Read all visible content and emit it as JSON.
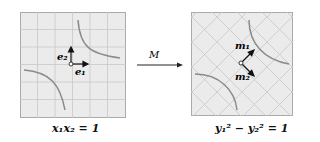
{
  "left_panel": {
    "caption": "x₁x₂ = 1",
    "vector_labels": [
      "e₂",
      "e₁"
    ],
    "background": "#ebebeb",
    "grid_color": "#c8c8c8",
    "curve_color": "#8a8a8a"
  },
  "arrow": {
    "label": "M"
  },
  "right_panel": {
    "caption": "y₁² − y₂² = 1",
    "vector_labels": [
      "m₁",
      "m₂"
    ],
    "background": "#ebebeb",
    "grid_color": "#c8c8c8",
    "curve_color": "#8a8a8a"
  }
}
